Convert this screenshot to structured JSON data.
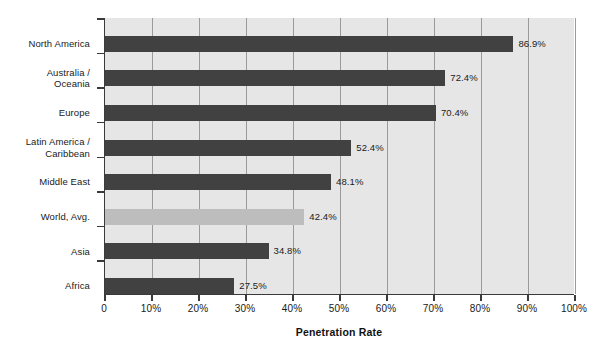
{
  "chart_data": {
    "type": "bar",
    "orientation": "horizontal",
    "title": "",
    "subtitle": "",
    "xlabel": "Penetration Rate",
    "ylabel": "",
    "xlim": [
      0,
      100
    ],
    "grid": true,
    "legend": false,
    "value_label_suffix": "%",
    "categories": [
      "North America",
      "Australia / Oceania",
      "Europe",
      "Latin America / Caribbean",
      "Middle East",
      "World, Avg.",
      "Asia",
      "Africa"
    ],
    "category_lines": [
      [
        "North America"
      ],
      [
        "Australia /",
        "Oceania"
      ],
      [
        "Europe"
      ],
      [
        "Latin America /",
        "Caribbean"
      ],
      [
        "Middle East"
      ],
      [
        "World, Avg."
      ],
      [
        "Asia"
      ],
      [
        "Africa"
      ]
    ],
    "values": [
      86.9,
      72.4,
      70.4,
      52.4,
      48.1,
      42.4,
      34.8,
      27.5
    ],
    "value_labels": [
      "86.9%",
      "72.4%",
      "70.4%",
      "52.4%",
      "48.1%",
      "42.4%",
      "34.8%",
      "27.5%"
    ],
    "bar_styles": [
      "normal",
      "normal",
      "normal",
      "normal",
      "normal",
      "highlight",
      "normal",
      "normal"
    ],
    "xticks": [
      0,
      10,
      20,
      30,
      40,
      50,
      60,
      70,
      80,
      90,
      100
    ],
    "xtick_labels": [
      "0",
      "10%",
      "20%",
      "30%",
      "40%",
      "50%",
      "60%",
      "70%",
      "80%",
      "90%",
      "100%"
    ],
    "colors": {
      "bar": "#414141",
      "bar_highlight": "#bdbdbd",
      "plot_background": "#e6e6e6",
      "gridline": "#9a9a9a",
      "axis": "#3a3a3a",
      "text": "#1a1a1a",
      "page_background": "#ffffff"
    }
  }
}
